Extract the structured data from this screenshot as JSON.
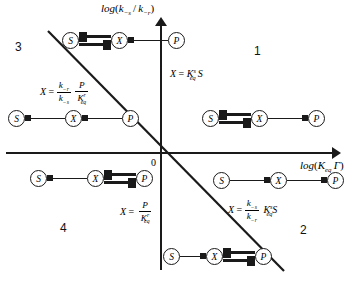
{
  "figure": {
    "axes": {
      "y_label_plain": "log(k_-s / k_-r)",
      "x_label_plain": "log(K_eq Γ)",
      "origin_label": "0"
    },
    "quadrants": [
      {
        "id": "q1",
        "label": "1"
      },
      {
        "id": "q2",
        "label": "2"
      },
      {
        "id": "q3",
        "label": "3"
      },
      {
        "id": "q4",
        "label": "4"
      }
    ],
    "boundary_line": {
      "name": "diagonal-separatrix",
      "slope": "negative"
    },
    "equations": [
      {
        "id": "eq-upper-right",
        "plain": "X = K_eq^s S"
      },
      {
        "id": "eq-upper-left",
        "plain": "X = (k_-r / k_-s)(P / K_eq^r)"
      },
      {
        "id": "eq-lower-left",
        "plain": "X = P / K_eq^r"
      },
      {
        "id": "eq-lower-right",
        "plain": "X = (k_-s / k_-r) K_eq^s S"
      }
    ],
    "species": {
      "s": "S",
      "x": "X",
      "p": "P"
    },
    "reactions": [
      {
        "id": "rxn-top",
        "plain": "S <=> X <- P"
      },
      {
        "id": "rxn-mid-left",
        "plain": "S <- X <- P"
      },
      {
        "id": "rxn-mid-right",
        "plain": "S <=> X -> P"
      },
      {
        "id": "rxn-lower-left",
        "plain": "S <- X <=> P"
      },
      {
        "id": "rxn-lower-right",
        "plain": "S -> X -> P"
      },
      {
        "id": "rxn-bottom",
        "plain": "S -> X <=> P"
      }
    ]
  },
  "colors": {
    "ink": "#1a1a1a",
    "background": "#ffffff"
  }
}
